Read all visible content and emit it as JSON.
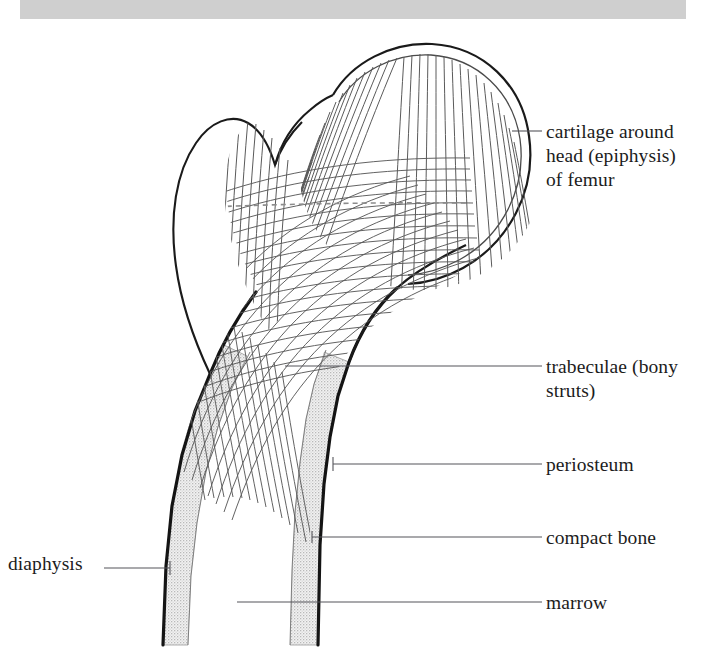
{
  "figure": {
    "top_band": {
      "name": "grey-header-band",
      "color": "#cfcfcf"
    },
    "colors": {
      "outline": "#1a1a1a",
      "trabecula_line": "#545454",
      "compact_bone_fill": "#e9e9e9",
      "periosteum": "#141414",
      "marrow_fill": "#ffffff",
      "leader_line": "#55555a",
      "label_text": "#1c1c1c"
    }
  },
  "labels": {
    "cartilage": "cartilage around\nhead (epiphysis)\nof femur",
    "trabeculae": "trabeculae (bony\nstruts)",
    "periosteum": "periosteum",
    "compact_bone": "compact bone",
    "marrow": "marrow",
    "diaphysis": "diaphysis"
  },
  "structures": [
    {
      "key": "cartilage",
      "name": "cartilage-layer",
      "leader_from": [
        512,
        131
      ],
      "leader_to": [
        542,
        131
      ]
    },
    {
      "key": "trabeculae",
      "name": "trabeculae-region",
      "leader_from": [
        285,
        366
      ],
      "leader_to": [
        542,
        366
      ]
    },
    {
      "key": "periosteum",
      "name": "periosteum-layer",
      "leader_from": [
        333,
        464
      ],
      "leader_to": [
        542,
        464
      ]
    },
    {
      "key": "compact_bone",
      "name": "compact-bone-layer",
      "leader_from": [
        312,
        537
      ],
      "leader_to": [
        542,
        537
      ]
    },
    {
      "key": "marrow",
      "name": "marrow-cavity",
      "leader_from": [
        237,
        602
      ],
      "leader_to": [
        542,
        602
      ]
    },
    {
      "key": "diaphysis",
      "name": "diaphysis-shaft",
      "leader_from": [
        104,
        568
      ],
      "leader_to": [
        170,
        568
      ]
    }
  ]
}
